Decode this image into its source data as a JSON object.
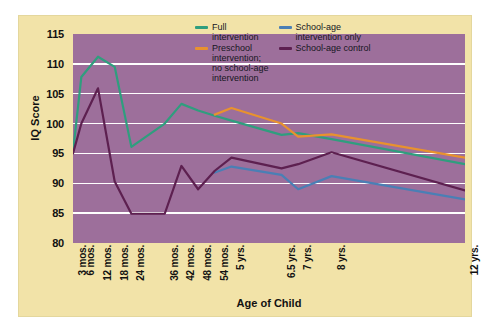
{
  "chart_data": {
    "type": "line",
    "title": "",
    "xlabel": "Age of Child",
    "ylabel": "IQ Score",
    "ylim": [
      80,
      115
    ],
    "yticks": [
      115,
      110,
      105,
      100,
      95,
      90,
      85,
      80
    ],
    "gridlines": [
      110,
      105,
      100,
      95,
      90,
      85
    ],
    "grid": true,
    "legend_position": "top-right",
    "categories": [
      "3 mos.",
      "6 mos.",
      "12 mos.",
      "18 mos.",
      "24 mos.",
      "36 mos.",
      "42 mos.",
      "48 mos.",
      "54 mos.",
      "5 yrs.",
      "6.5 yrs.",
      "7 yrs.",
      "8 yrs.",
      "12 yrs."
    ],
    "x_months": [
      3,
      6,
      12,
      18,
      24,
      36,
      42,
      48,
      54,
      60,
      78,
      84,
      96,
      144
    ],
    "series": [
      {
        "name": "Full intervention",
        "color": "#2f9e7e",
        "values": [
          95.2,
          107.8,
          111.2,
          109.5,
          96.1,
          100.0,
          103.3,
          102.2,
          101.3,
          100.5,
          98.1,
          98.4,
          97.4,
          93.2
        ]
      },
      {
        "name": "Preschool intervention; no school-age intervention",
        "color": "#e8922e",
        "values": [
          null,
          null,
          null,
          null,
          null,
          null,
          null,
          null,
          101.5,
          102.6,
          100.0,
          97.8,
          98.2,
          94.3
        ]
      },
      {
        "name": "School-age intervention only",
        "color": "#4a7fb5",
        "values": [
          null,
          null,
          null,
          null,
          null,
          null,
          null,
          null,
          91.8,
          92.8,
          91.4,
          89.0,
          91.2,
          87.3
        ]
      },
      {
        "name": "School-age control",
        "color": "#5d2050",
        "values": [
          95.0,
          100.0,
          105.9,
          90.3,
          84.9,
          84.9,
          92.9,
          89.0,
          92.1,
          94.3,
          92.5,
          93.2,
          95.2,
          88.8
        ]
      }
    ]
  },
  "axes": {
    "y_title": "IQ Score",
    "x_title": "Age of Child",
    "y_ticks": [
      "115",
      "110",
      "105",
      "100",
      "95",
      "90",
      "85",
      "80"
    ],
    "x_ticks": [
      "3 mos.",
      "6 mos.",
      "12 mos.",
      "18 mos.",
      "24 mos.",
      "36 mos.",
      "42 mos.",
      "48 mos.",
      "54 mos.",
      "5 yrs.",
      "6.5 yrs.",
      "7 yrs.",
      "8 yrs.",
      "12 yrs."
    ]
  },
  "legend": {
    "columns": [
      {
        "entries": [
          {
            "label": "Full\nintervention",
            "color": "#2f9e7e"
          },
          {
            "label": "Preschool\nintervention;\nno school-age\nintervention",
            "color": "#e8922e"
          }
        ]
      },
      {
        "entries": [
          {
            "label": "School-age\nintervention only",
            "color": "#4a7fb5"
          },
          {
            "label": "School-age control",
            "color": "#5d2050"
          }
        ]
      }
    ]
  },
  "colors": {
    "page_background": "#ffffff",
    "figure_background": "#f2e3a8",
    "plot_background": "#9d6f9b",
    "gridline": "#ffffff",
    "text": "#111111"
  }
}
